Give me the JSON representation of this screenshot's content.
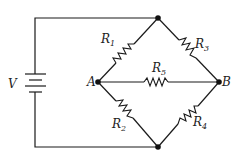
{
  "diagram": {
    "type": "Wheatstone bridge circuit",
    "source": {
      "label": "V",
      "symbol": "battery"
    },
    "nodes": [
      {
        "id": "A",
        "label": "A"
      },
      {
        "id": "B",
        "label": "B"
      },
      {
        "id": "top",
        "label": ""
      },
      {
        "id": "bottom",
        "label": ""
      }
    ],
    "resistors": [
      {
        "id": "R1",
        "letter": "R",
        "sub": "1",
        "from": "A",
        "to": "top"
      },
      {
        "id": "R2",
        "letter": "R",
        "sub": "2",
        "from": "A",
        "to": "bottom"
      },
      {
        "id": "R3",
        "letter": "R",
        "sub": "3",
        "from": "top",
        "to": "B"
      },
      {
        "id": "R4",
        "letter": "R",
        "sub": "4",
        "from": "bottom",
        "to": "B"
      },
      {
        "id": "R5",
        "letter": "R",
        "sub": "5",
        "from": "A",
        "to": "B"
      }
    ],
    "colors": {
      "line": "#1a1a1a",
      "background": "#ffffff"
    }
  }
}
